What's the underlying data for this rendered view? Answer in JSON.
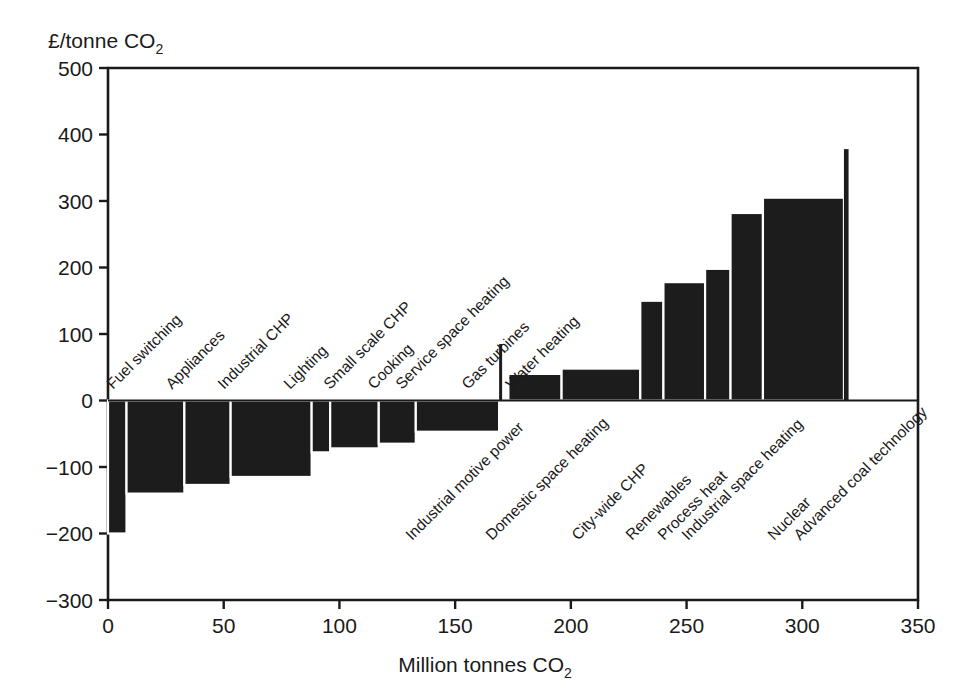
{
  "chart_data": {
    "type": "bar",
    "title": "",
    "subtitle": "",
    "xlabel": "Million tonnes CO2",
    "xlabel_main": "Million tonnes CO",
    "xlabel_sub": "2",
    "ylabel": "£/tonne CO2",
    "ylabel_main": "£/tonne CO",
    "ylabel_sub": "2",
    "xlim": [
      0,
      350
    ],
    "ylim": [
      -300,
      500
    ],
    "xticks": [
      0,
      50,
      100,
      150,
      200,
      250,
      300,
      350
    ],
    "xtick_labels": [
      "0",
      "50",
      "100",
      "150",
      "200",
      "250",
      "300",
      "350"
    ],
    "yticks": [
      -300,
      -200,
      -100,
      0,
      100,
      200,
      300,
      400,
      500
    ],
    "ytick_labels": [
      "-300",
      "-200",
      "-100",
      "0",
      "100",
      "200",
      "300",
      "400",
      "500"
    ],
    "grid": false,
    "legend": "none",
    "bar_color": "#1c1c1c",
    "note": "Marginal abatement cost curve: bar width = abatement potential (Mt CO2), bar height = cost (GBP/tonne CO2)",
    "categories": [
      "Fuel switching",
      "Appliances",
      "Industrial CHP",
      "Lighting",
      "Small scale CHP",
      "Cooking",
      "Service space heating",
      "Gas turbines",
      "Water heating",
      "Industrial motive power",
      "Domestic space heating",
      "City-wide CHP",
      "Renewables",
      "Process heat",
      "Industrial space heating",
      "Nuclear",
      "Advanced coal technology"
    ],
    "bars": [
      {
        "label": "Fuel switching",
        "x0": 0,
        "x1": 8,
        "value": -200,
        "label_side": "above"
      },
      {
        "label": "Appliances",
        "x0": 8,
        "x1": 33,
        "value": -140,
        "label_side": "above"
      },
      {
        "label": "Industrial CHP",
        "x0": 33,
        "x1": 53,
        "value": -127,
        "label_side": "above"
      },
      {
        "label": "Lighting",
        "x0": 53,
        "x1": 88,
        "value": -115,
        "label_side": "above"
      },
      {
        "label": "Small scale CHP",
        "x0": 88,
        "x1": 96,
        "value": -78,
        "label_side": "above"
      },
      {
        "label": "Cooking",
        "x0": 96,
        "x1": 117,
        "value": -72,
        "label_side": "above"
      },
      {
        "label": "Service space heating",
        "x0": 117,
        "x1": 133,
        "value": -65,
        "label_side": "above"
      },
      {
        "label": "Gas turbines",
        "x0": 133,
        "x1": 169,
        "value": -47,
        "label_side": "above"
      },
      {
        "label": "Water heating",
        "x0": 169,
        "x1": 170,
        "value": 85,
        "label_side": "above"
      },
      {
        "label": "Industrial motive power",
        "x0": 173,
        "x1": 196,
        "value": 40,
        "label_side": "below"
      },
      {
        "label": "Domestic space heating",
        "x0": 196,
        "x1": 230,
        "value": 48,
        "label_side": "below"
      },
      {
        "label": "City-wide CHP",
        "x0": 230,
        "x1": 240,
        "value": 150,
        "label_side": "below"
      },
      {
        "label": "Renewables",
        "x0": 240,
        "x1": 258,
        "value": 178,
        "label_side": "below"
      },
      {
        "label": "Process heat",
        "x0": 258,
        "x1": 269,
        "value": 198,
        "label_side": "below"
      },
      {
        "label": "Industrial space heating",
        "x0": 269,
        "x1": 283,
        "value": 282,
        "label_side": "below"
      },
      {
        "label": "Nuclear",
        "x0": 283,
        "x1": 318,
        "value": 305,
        "label_side": "below"
      },
      {
        "label": "Advanced coal technology",
        "x0": 318,
        "x1": 320,
        "value": 378,
        "label_side": "below"
      }
    ],
    "labels_above": [
      {
        "text": "Fuel switching",
        "x": 113,
        "y": 390
      },
      {
        "text": "Appliances",
        "x": 172,
        "y": 390
      },
      {
        "text": "Industrial CHP",
        "x": 224,
        "y": 390
      },
      {
        "text": "Lighting",
        "x": 290,
        "y": 390
      },
      {
        "text": "Small scale CHP",
        "x": 330,
        "y": 390
      },
      {
        "text": "Cooking",
        "x": 374,
        "y": 390
      },
      {
        "text": "Service space heating",
        "x": 402,
        "y": 390
      },
      {
        "text": "Gas turbines",
        "x": 468,
        "y": 390
      },
      {
        "text": "Water heating",
        "x": 512,
        "y": 390
      }
    ],
    "labels_below": [
      {
        "text": "Industrial motive power",
        "x": 412,
        "y": 541
      },
      {
        "text": "Domestic space heating",
        "x": 492,
        "y": 541
      },
      {
        "text": "City-wide CHP",
        "x": 578,
        "y": 541
      },
      {
        "text": "Renewables",
        "x": 632,
        "y": 541
      },
      {
        "text": "Process heat",
        "x": 664,
        "y": 541
      },
      {
        "text": "Industrial space heating",
        "x": 688,
        "y": 541
      },
      {
        "text": "Nuclear",
        "x": 774,
        "y": 541
      },
      {
        "text": "Advanced coal technology",
        "x": 800,
        "y": 541
      }
    ]
  }
}
